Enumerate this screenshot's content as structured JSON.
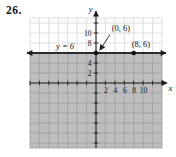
{
  "figure": {
    "problem_number": "26."
  },
  "colors": {
    "background": "#ffffff",
    "shade": "#bdbdbd",
    "grid_on_white": "#d6d6d6",
    "grid_on_shade": "#9f9f9f",
    "axis": "#1f1f1f",
    "line": "#2b2b2b",
    "point": "#111111",
    "text": "#111111"
  },
  "chart_data": {
    "type": "line",
    "xlabel": "x",
    "ylabel": "y",
    "x_range": [
      -14,
      14
    ],
    "y_range": [
      -13,
      13
    ],
    "grid_step": 2,
    "grid": true,
    "x_tick_labels": [
      2,
      4,
      6,
      8,
      10
    ],
    "y_tick_labels": [
      2,
      4,
      8,
      10
    ],
    "line": {
      "y": 6,
      "label": "y = 6"
    },
    "points": [
      {
        "x": 0,
        "y": 6,
        "label": "(0, 6)",
        "callout_arrow": true
      },
      {
        "x": 8,
        "y": 6,
        "label": "(8, 6)",
        "callout_arrow": false
      }
    ],
    "shaded_region": "y <= 6",
    "legend": null
  }
}
